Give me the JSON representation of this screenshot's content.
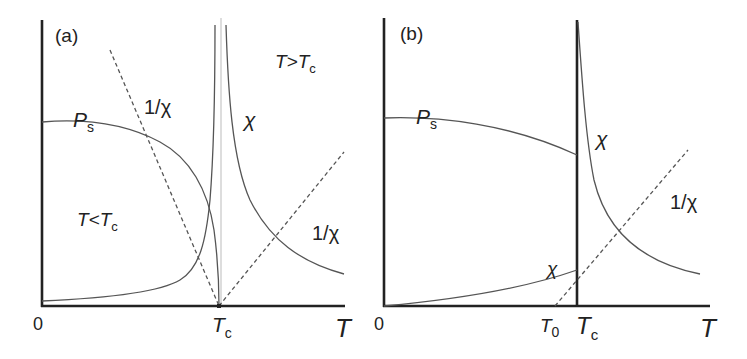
{
  "panels": [
    {
      "id": "a",
      "tag": "(a)",
      "origin_label": "0",
      "x_axis_label": "T",
      "tc_label": {
        "main": "T",
        "sub": "c"
      },
      "region_above": {
        "main": "T>T",
        "sub": "c"
      },
      "region_below": {
        "main": "T<T",
        "sub": "c"
      },
      "curve_labels": {
        "ps": {
          "main": "P",
          "sub": "s"
        },
        "chi": "χ",
        "inv_chi_left": "1/χ",
        "inv_chi_right": "1/χ"
      },
      "description": "Second-order transition: P_s falls continuously to zero at T_c; χ diverges on both sides of T_c; 1/χ dashed lines go linearly to zero at T_c."
    },
    {
      "id": "b",
      "tag": "(b)",
      "origin_label": "0",
      "x_axis_label": "T",
      "tc_label": {
        "main": "T",
        "sub": "c"
      },
      "t0_label": {
        "main": "T",
        "sub": "0"
      },
      "curve_labels": {
        "ps": {
          "main": "P",
          "sub": "s"
        },
        "chi_upper": "χ",
        "chi_lower": "χ",
        "inv_chi": "1/χ"
      },
      "description": "First-order transition: P_s drops discontinuously at T_c; χ jumps at T_c; 1/χ extrapolates to zero at T_0 < T_c."
    }
  ],
  "colors": {
    "axis": "#222222",
    "curve": "#555555",
    "guide": "#bbbbbb",
    "background": "#ffffff"
  }
}
